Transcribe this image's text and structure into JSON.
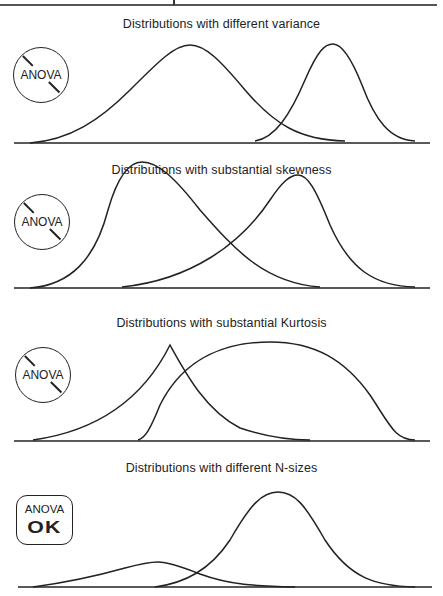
{
  "panels": [
    {
      "title": "Distributions with different variance",
      "badge": {
        "type": "prohibited",
        "label": "ANOVA"
      },
      "curves": [
        {
          "name": "wide-normal",
          "d": "M30,143 C70,140 100,120 130,90 C160,60 175,45 190,45 C205,45 220,60 245,90 C275,125 300,140 345,141"
        },
        {
          "name": "narrow-normal",
          "d": "M255,141 C275,138 290,115 305,80 C318,50 325,44 333,44 C341,44 350,55 362,85 C375,120 390,140 415,141"
        }
      ],
      "baseline": {
        "x1": 14,
        "x2": 430,
        "y": 143
      }
    },
    {
      "title": "Distributions with substantial skewness",
      "badge": {
        "type": "prohibited",
        "label": "ANOVA"
      },
      "curves": [
        {
          "name": "right-skewed",
          "d": "M30,288 C70,285 95,260 108,210 C118,175 130,162 142,162 C158,162 175,178 200,210 C235,250 265,283 320,287"
        },
        {
          "name": "left-skewed",
          "d": "M122,287 C190,280 240,245 270,200 C282,182 290,175 298,175 C308,175 316,190 330,225 C350,270 375,286 415,287"
        }
      ],
      "baseline": {
        "x1": 14,
        "x2": 430,
        "y": 288
      }
    },
    {
      "title": "Distributions with substantial Kurtosis",
      "badge": {
        "type": "prohibited",
        "label": "ANOVA"
      },
      "curves": [
        {
          "name": "peaked-leptokurtic",
          "d": "M33,440 C90,432 140,405 170,345 C185,372 205,410 240,428 C270,438 295,440 310,440"
        },
        {
          "name": "flat-platykurtic",
          "d": "M138,440 C145,438 150,430 160,405 C185,355 230,342 270,342 C315,342 345,360 370,395 C390,425 395,440 415,440"
        }
      ],
      "baseline": {
        "x1": 14,
        "x2": 430,
        "y": 441
      }
    },
    {
      "title": "Distributions with different N-sizes",
      "badge": {
        "type": "ok",
        "label": "ANOVA",
        "ok_text": "OK"
      },
      "curves": [
        {
          "name": "small-n-distribution",
          "d": "M33,587 C70,582 100,575 125,568 C140,564 150,562 158,562 C168,562 180,566 200,574 C230,585 255,586 295,587"
        },
        {
          "name": "large-n-distribution",
          "d": "M155,587 C185,583 210,570 230,540 C250,505 262,492 278,492 C295,492 305,505 325,540 C350,578 375,586 415,587"
        }
      ],
      "baseline": {
        "x1": 18,
        "x2": 432,
        "y": 587
      }
    }
  ],
  "colors": {
    "ink": "#222222",
    "rule": "#555555",
    "background": "#ffffff"
  }
}
